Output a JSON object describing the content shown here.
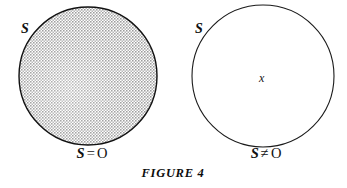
{
  "figure": {
    "caption": "FIGURE 4",
    "caption_x": 173,
    "caption_y": 167,
    "background_color": "#ffffff",
    "stroke_color": "#111111",
    "fill_color": "#d6d6d6"
  },
  "panels": [
    {
      "id": "empty-set-panel",
      "set_label": "S",
      "set_label_x": 21,
      "set_label_y": 22,
      "circle": {
        "cx": 88,
        "cy": 76,
        "r": 69,
        "filled": true,
        "fill_description": "stippled-gray-halftone"
      },
      "element_label": null,
      "equation": {
        "variable": "S",
        "relation": "=",
        "nullset": "O",
        "text": "S = O",
        "x": 92,
        "y": 146
      }
    },
    {
      "id": "nonempty-set-panel",
      "set_label": "S",
      "set_label_x": 195,
      "set_label_y": 22,
      "circle": {
        "cx": 263,
        "cy": 76,
        "r": 71,
        "filled": false,
        "fill_description": "none"
      },
      "element_label": {
        "text": "x",
        "x": 259,
        "y": 72
      },
      "equation": {
        "variable": "S",
        "relation": "≠",
        "nullset": "O",
        "text": "S ≠ O",
        "x": 266,
        "y": 146
      }
    }
  ]
}
